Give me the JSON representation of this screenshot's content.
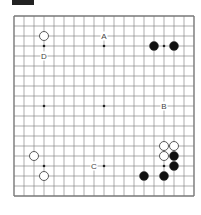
{
  "diagram": {
    "type": "go-board",
    "size": 19,
    "colors": {
      "line": "#777777",
      "black_stone": "#111111",
      "white_stone": "#ffffff",
      "stone_outline": "#333333",
      "star": "#222222"
    },
    "star_points": [
      [
        3,
        3
      ],
      [
        9,
        3
      ],
      [
        15,
        3
      ],
      [
        3,
        9
      ],
      [
        9,
        9
      ],
      [
        15,
        9
      ],
      [
        3,
        15
      ],
      [
        9,
        15
      ],
      [
        15,
        15
      ]
    ],
    "stones": [
      {
        "color": "white",
        "col": 3,
        "row": 2
      },
      {
        "color": "black",
        "col": 14,
        "row": 3
      },
      {
        "color": "black",
        "col": 16,
        "row": 3
      },
      {
        "color": "white",
        "col": 15,
        "row": 13
      },
      {
        "color": "white",
        "col": 16,
        "row": 13
      },
      {
        "color": "white",
        "col": 15,
        "row": 14
      },
      {
        "color": "black",
        "col": 16,
        "row": 14
      },
      {
        "color": "black",
        "col": 16,
        "row": 15
      },
      {
        "color": "black",
        "col": 15,
        "row": 16
      },
      {
        "color": "black",
        "col": 13,
        "row": 16
      },
      {
        "color": "white",
        "col": 2,
        "row": 14
      },
      {
        "color": "white",
        "col": 3,
        "row": 16
      }
    ],
    "labels": [
      {
        "text": "A",
        "col": 9,
        "row": 2
      },
      {
        "text": "D",
        "col": 3,
        "row": 4
      },
      {
        "text": "B",
        "col": 15,
        "row": 9
      },
      {
        "text": "C",
        "col": 8,
        "row": 15
      }
    ]
  }
}
